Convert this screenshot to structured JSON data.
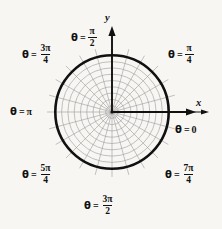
{
  "figure": {
    "type": "polar-coordinate-grid",
    "title": "",
    "background_color": "#f7f6f3",
    "ink_color": "#111111",
    "grid_color": "#999999",
    "center": {
      "x": 112,
      "y": 112
    },
    "bold_circle_radius": 57,
    "thin_circle_count": 9,
    "radial_spoke_count": 24,
    "spoke_step_degrees": 15
  },
  "axes": {
    "x_label": "x",
    "y_label": "y",
    "x_arrow": "arrow-right",
    "y_arrow": "arrow-up"
  },
  "angle_labels": [
    {
      "id": "theta-0",
      "theta": "θ",
      "eq": "=",
      "value": "0",
      "kind": "plain",
      "degrees": 0
    },
    {
      "id": "theta-pi-4",
      "theta": "θ",
      "eq": "=",
      "num": "π",
      "den": "4",
      "kind": "fraction",
      "degrees": 45
    },
    {
      "id": "theta-pi-2",
      "theta": "θ",
      "eq": "=",
      "num": "π",
      "den": "2",
      "kind": "fraction",
      "degrees": 90
    },
    {
      "id": "theta-3pi-4",
      "theta": "θ",
      "eq": "=",
      "num": "3π",
      "den": "4",
      "kind": "fraction",
      "degrees": 135
    },
    {
      "id": "theta-pi",
      "theta": "θ",
      "eq": "=",
      "value": "π",
      "kind": "plain",
      "degrees": 180
    },
    {
      "id": "theta-5pi-4",
      "theta": "θ",
      "eq": "=",
      "num": "5π",
      "den": "4",
      "kind": "fraction",
      "degrees": 225
    },
    {
      "id": "theta-3pi-2",
      "theta": "θ",
      "eq": "=",
      "num": "3π",
      "den": "2",
      "kind": "fraction",
      "degrees": 270
    },
    {
      "id": "theta-7pi-4",
      "theta": "θ",
      "eq": "=",
      "num": "7π",
      "den": "4",
      "kind": "fraction",
      "degrees": 315
    }
  ]
}
